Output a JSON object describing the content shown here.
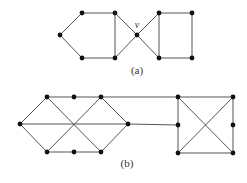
{
  "figures": [
    {
      "id": "a",
      "caption": "(a)",
      "caption_pos": [
        137,
        74
      ],
      "vertex_label": {
        "text": "v",
        "pos": [
          137,
          28
        ]
      },
      "nodes": [
        {
          "x": 60,
          "y": 35
        },
        {
          "x": 82,
          "y": 13
        },
        {
          "x": 115,
          "y": 13
        },
        {
          "x": 82,
          "y": 58
        },
        {
          "x": 115,
          "y": 58
        },
        {
          "x": 137,
          "y": 35
        },
        {
          "x": 159,
          "y": 13
        },
        {
          "x": 192,
          "y": 13
        },
        {
          "x": 159,
          "y": 58
        },
        {
          "x": 192,
          "y": 58
        }
      ],
      "edges": [
        [
          0,
          1
        ],
        [
          1,
          2
        ],
        [
          0,
          3
        ],
        [
          3,
          4
        ],
        [
          2,
          4
        ],
        [
          2,
          5
        ],
        [
          4,
          5
        ],
        [
          5,
          6
        ],
        [
          5,
          8
        ],
        [
          6,
          7
        ],
        [
          7,
          9
        ],
        [
          8,
          9
        ],
        [
          6,
          8
        ]
      ]
    },
    {
      "id": "b",
      "caption": "(b)",
      "caption_pos": [
        127,
        167
      ],
      "nodes": [
        {
          "x": 20,
          "y": 124
        },
        {
          "x": 47,
          "y": 97
        },
        {
          "x": 74,
          "y": 97
        },
        {
          "x": 101,
          "y": 97
        },
        {
          "x": 128,
          "y": 124
        },
        {
          "x": 47,
          "y": 152
        },
        {
          "x": 74,
          "y": 152
        },
        {
          "x": 101,
          "y": 152
        },
        {
          "x": 178,
          "y": 97
        },
        {
          "x": 233,
          "y": 97
        },
        {
          "x": 178,
          "y": 125
        },
        {
          "x": 233,
          "y": 125
        },
        {
          "x": 178,
          "y": 153
        },
        {
          "x": 233,
          "y": 153
        }
      ],
      "edges": [
        [
          0,
          1
        ],
        [
          1,
          2
        ],
        [
          2,
          3
        ],
        [
          3,
          4
        ],
        [
          0,
          5
        ],
        [
          5,
          6
        ],
        [
          6,
          7
        ],
        [
          7,
          4
        ],
        [
          0,
          4
        ],
        [
          1,
          7
        ],
        [
          3,
          5
        ],
        [
          3,
          8
        ],
        [
          4,
          10
        ],
        [
          8,
          9
        ],
        [
          8,
          10
        ],
        [
          10,
          12
        ],
        [
          12,
          13
        ],
        [
          9,
          11
        ],
        [
          11,
          13
        ],
        [
          8,
          13
        ],
        [
          9,
          12
        ]
      ]
    }
  ]
}
